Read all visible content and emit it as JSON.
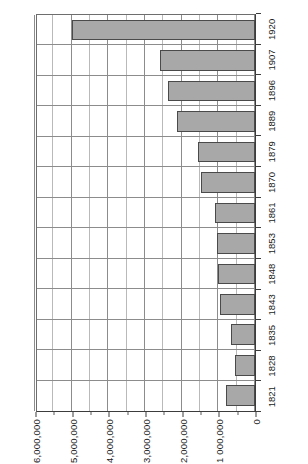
{
  "chart_data": {
    "type": "bar",
    "orientation": "rotated-90",
    "title": "",
    "subtitle": "",
    "xlabel": "",
    "ylabel": "",
    "categories": [
      "1821",
      "1828",
      "1835",
      "1843",
      "1848",
      "1853",
      "1861",
      "1870",
      "1879",
      "1889",
      "1896",
      "1907",
      "1920"
    ],
    "values": [
      795000,
      545000,
      660000,
      965000,
      1000000,
      1025000,
      1090000,
      1480000,
      1545000,
      2140000,
      2365000,
      2590000,
      5000000
    ],
    "series": [
      {
        "name": "Total",
        "values": [
          795000,
          545000,
          660000,
          965000,
          1000000,
          1025000,
          1090000,
          1480000,
          1545000,
          2140000,
          2365000,
          2590000,
          5000000
        ]
      }
    ],
    "ylim": [
      0,
      6000000
    ],
    "ytick_labels": [
      "0",
      "1 000,000",
      "2,000,000",
      "3,000,000",
      "4,000,000",
      "5,000,000",
      "6,000,000"
    ],
    "ytick_values": [
      0,
      1000000,
      2000000,
      3000000,
      4000000,
      5000000,
      6000000
    ],
    "minor_tick_step": 500000,
    "grid": true,
    "legend": "none",
    "bar_fill_color": "#a8a8a8",
    "bar_border_color": "#4a4a4a",
    "grid_color": "#8c8c8c",
    "axis_color": "#3c3c3c",
    "background_color": "#ffffff"
  }
}
